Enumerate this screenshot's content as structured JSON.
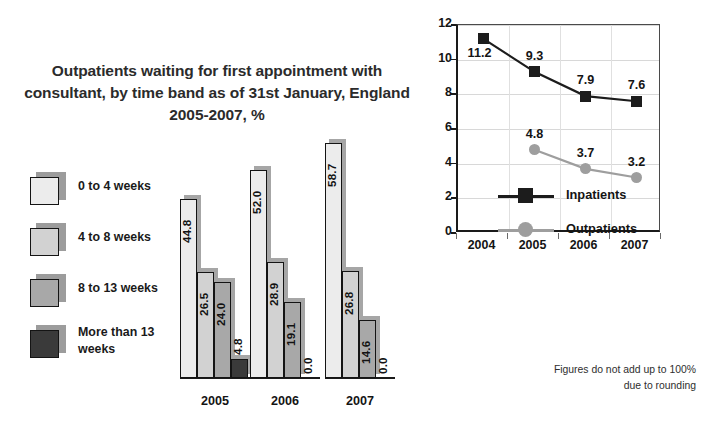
{
  "title": "Outpatients waiting for first appointment with consultant, by time band as of 31st January, England 2005-2007, %",
  "footnote_line1": "Figures do not add up to 100%",
  "footnote_line2": "due to rounding",
  "bar_legend": {
    "items": [
      {
        "label": "0 to 4 weeks",
        "color": "#ececec"
      },
      {
        "label": "4 to 8 weeks",
        "color": "#d2d2d2"
      },
      {
        "label": "8 to 13 weeks",
        "color": "#a8a8a8"
      },
      {
        "label": "More than 13 weeks",
        "color": "#3a3a3a"
      }
    ]
  },
  "chart_data": [
    {
      "type": "bar",
      "title": "Outpatients waiting for first appointment with consultant, by time band as of 31st January, England 2005-2007, %",
      "xlabel": "",
      "ylabel": "",
      "ylim": [
        0,
        60
      ],
      "grid": false,
      "legend_position": "left",
      "categories": [
        "2005",
        "2006",
        "2007"
      ],
      "series": [
        {
          "name": "0 to 4 weeks",
          "color": "#ececec",
          "values": [
            44.8,
            52.0,
            58.7
          ],
          "labels": [
            "44.8",
            "52.0",
            "58.7"
          ]
        },
        {
          "name": "4 to 8 weeks",
          "color": "#d2d2d2",
          "values": [
            26.5,
            28.9,
            26.8
          ],
          "labels": [
            "26.5",
            "28.9",
            "26.8"
          ]
        },
        {
          "name": "8 to 13 weeks",
          "color": "#a8a8a8",
          "values": [
            24.0,
            19.1,
            14.6
          ],
          "labels": [
            "24.0",
            "19.1",
            "14.6"
          ]
        },
        {
          "name": "More than 13 weeks",
          "color": "#3a3a3a",
          "values": [
            4.8,
            0.0,
            0.0
          ],
          "labels": [
            "4.8",
            "0.0",
            "0.0"
          ]
        }
      ]
    },
    {
      "type": "line",
      "title": "",
      "xlabel": "",
      "ylabel": "",
      "ylim": [
        0,
        12
      ],
      "yticks": [
        "0",
        "2",
        "4",
        "6",
        "8",
        "10",
        "12"
      ],
      "grid": true,
      "legend_position": "inside-bottom-left",
      "x": [
        "2004",
        "2005",
        "2006",
        "2007"
      ],
      "series": [
        {
          "name": "Inpatients",
          "color": "#1c1c1c",
          "marker": "square",
          "values": [
            11.2,
            9.3,
            7.9,
            7.6
          ],
          "labels": [
            "11.2",
            "9.3",
            "7.9",
            "7.6"
          ]
        },
        {
          "name": "Outpatients",
          "color": "#9e9e9e",
          "marker": "circle",
          "values": [
            null,
            4.8,
            3.7,
            3.2
          ],
          "labels": [
            "",
            "4.8",
            "3.7",
            "3.2"
          ]
        }
      ]
    }
  ]
}
